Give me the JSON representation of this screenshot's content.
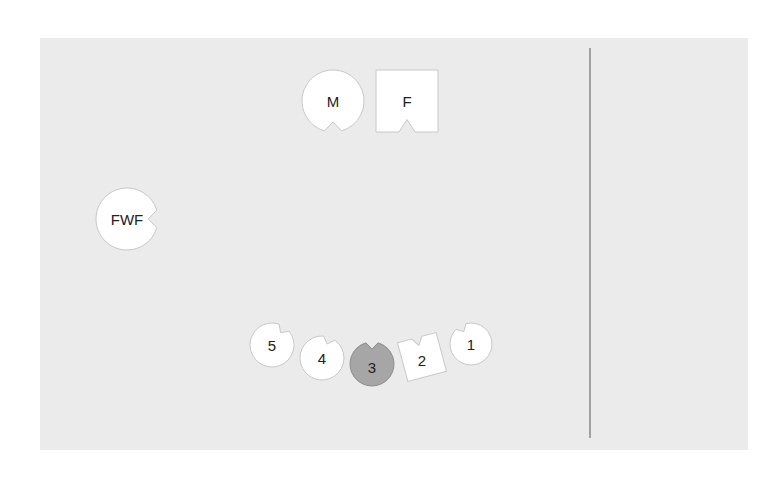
{
  "diagram": {
    "type": "seating-layout",
    "canvas": {
      "width": 776,
      "height": 483,
      "background": "#ffffff"
    },
    "room": {
      "x": 40,
      "y": 38,
      "width": 708,
      "height": 412,
      "fill": "#ebebeb"
    },
    "divider": {
      "x": 590,
      "y1": 48,
      "y2": 438,
      "color": "#888888"
    },
    "colors": {
      "seat_fill": "#ffffff",
      "seat_stroke": "#c8c8c8",
      "highlight_fill": "#a6a6a6",
      "highlight_stroke": "#8c8c8c",
      "text": "#222222"
    },
    "seats": [
      {
        "id": "M",
        "label": "M",
        "shape": "circle",
        "cx": 333,
        "cy": 101,
        "r": 31,
        "notch_angle": 90,
        "highlight": false
      },
      {
        "id": "F",
        "label": "F",
        "shape": "square",
        "cx": 407,
        "cy": 101,
        "size": 62,
        "rotation": 0,
        "notch_angle": 90,
        "highlight": false
      },
      {
        "id": "FWF",
        "label": "FWF",
        "shape": "circle",
        "cx": 127,
        "cy": 219,
        "r": 31,
        "notch_angle": 0,
        "highlight": false
      },
      {
        "id": "5",
        "label": "5",
        "shape": "circle",
        "cx": 272,
        "cy": 345,
        "r": 22,
        "notch_angle": -55,
        "highlight": false
      },
      {
        "id": "4",
        "label": "4",
        "shape": "circle",
        "cx": 322,
        "cy": 358,
        "r": 22,
        "notch_angle": -70,
        "highlight": false
      },
      {
        "id": "3",
        "label": "3",
        "shape": "circle",
        "cx": 372,
        "cy": 364,
        "r": 22,
        "notch_angle": -90,
        "highlight": true
      },
      {
        "id": "2",
        "label": "2",
        "shape": "square",
        "cx": 422,
        "cy": 357,
        "size": 40,
        "rotation": -15,
        "notch_angle": -90,
        "highlight": false
      },
      {
        "id": "1",
        "label": "1",
        "shape": "circle",
        "cx": 471,
        "cy": 344,
        "r": 21,
        "notch_angle": -120,
        "highlight": false
      }
    ]
  }
}
